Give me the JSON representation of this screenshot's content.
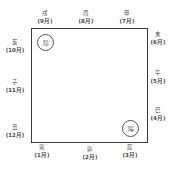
{
  "diagram": {
    "top": [
      {
        "branch": "戌",
        "month": "(9月)"
      },
      {
        "branch": "酉",
        "month": "(8月)"
      },
      {
        "branch": "申",
        "month": "(7月)"
      }
    ],
    "right": [
      {
        "branch": "未",
        "month": "(6月)"
      },
      {
        "branch": "午",
        "month": "(5月)"
      },
      {
        "branch": "巳",
        "month": "(4月)"
      }
    ],
    "bottom": [
      {
        "branch": "寅",
        "month": "(1月)"
      },
      {
        "branch": "卯",
        "month": "(2月)"
      },
      {
        "branch": "辰",
        "month": "(3月)"
      }
    ],
    "left": [
      {
        "branch": "亥",
        "month": "(10月)"
      },
      {
        "branch": "子",
        "month": "(11月)"
      },
      {
        "branch": "丑",
        "month": "(12月)"
      }
    ],
    "yin_label": "陰",
    "yang_label": "陽"
  }
}
